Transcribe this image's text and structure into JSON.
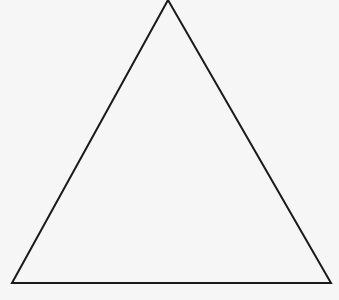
{
  "diagram": {
    "shape": "triangle",
    "vertices": {
      "apex": [
        168,
        0
      ],
      "bottom_left": [
        12,
        283
      ],
      "bottom_right": [
        331,
        283
      ]
    },
    "stroke_color": "#1a1a1a",
    "stroke_width": 2,
    "fill_color": "#f6f6f6",
    "background_color": "#f6f6f6"
  }
}
